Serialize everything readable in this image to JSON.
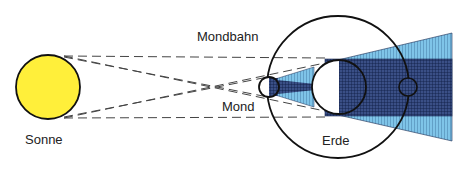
{
  "labels": {
    "sun": "Sonne",
    "moon_orbit": "Mondbahn",
    "moon": "Mond",
    "earth": "Erde"
  },
  "colors": {
    "sun_fill": "#ffef3a",
    "penumbra": "#7fc4e8",
    "umbra": "#2e3f72",
    "grid": "#0d1a40",
    "outline": "#111111",
    "dashes": "#444444"
  },
  "geometry": {
    "sun": {
      "cx": 48,
      "cy": 87,
      "r": 32
    },
    "orbit": {
      "cx": 338,
      "cy": 87,
      "r": 71
    },
    "earth": {
      "cx": 339,
      "cy": 87,
      "r": 27
    },
    "moon_left": {
      "cx": 269,
      "cy": 87,
      "r": 10
    },
    "moon_right": {
      "cx": 408,
      "cy": 87,
      "r": 9
    }
  }
}
